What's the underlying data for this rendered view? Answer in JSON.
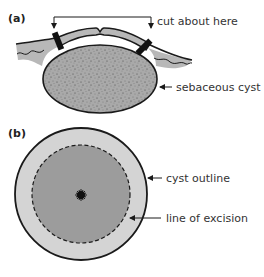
{
  "panels": {
    "a": {
      "label": "(a)",
      "annotations": {
        "cut": "cut about here",
        "cyst": "sebaceous cyst"
      }
    },
    "b": {
      "label": "(b)",
      "annotations": {
        "outline": "cyst outline",
        "excision": "line of excision"
      }
    }
  },
  "colors": {
    "skin": "#b8b8b8",
    "cyst_fill": "#a8a8a8",
    "outer_ring": "#d4d4d4",
    "inner_disc": "#9c9c9c",
    "stroke": "#1a1a1a",
    "text": "#333333"
  }
}
